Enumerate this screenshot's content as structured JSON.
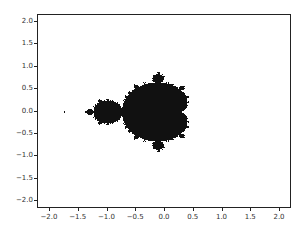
{
  "chart_data": {
    "type": "heatmap",
    "title": "",
    "xlabel": "",
    "ylabel": "",
    "xlim": [
      -2.2,
      2.2
    ],
    "ylim": [
      -2.2,
      2.2
    ],
    "grid": false,
    "legend": null,
    "x_ticks": [
      -2.0,
      -1.5,
      -1.0,
      -0.5,
      0.0,
      0.5,
      1.0,
      1.5,
      2.0
    ],
    "x_tick_labels": [
      "−2.0",
      "−1.5",
      "−1.0",
      "−0.5",
      "0.0",
      "0.5",
      "1.0",
      "1.5",
      "2.0"
    ],
    "y_ticks": [
      2.0,
      1.5,
      1.0,
      0.5,
      0.0,
      -0.5,
      -1.0,
      -1.5,
      -2.0
    ],
    "y_tick_labels": [
      "2.0",
      "1.5",
      "1.0",
      "0.5",
      "0.0",
      "−0.5",
      "−1.0",
      "−1.5",
      "−2.0"
    ],
    "max_iterations": 60,
    "fill_color": "#111111",
    "background_color": "#ffffff"
  },
  "layout": {
    "axes_px": {
      "left": 37,
      "top": 14,
      "width": 254,
      "height": 194
    },
    "x_zero_px": 164,
    "x_px_per_unit": 57.5,
    "y_zero_px": 110.5,
    "y_px_per_unit": 44.75
  }
}
